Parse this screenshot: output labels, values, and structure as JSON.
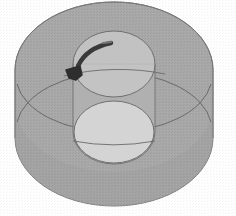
{
  "diagram": {
    "title": "",
    "colors": {
      "background": "#ffffff",
      "outer_fill": "#a9a9a9",
      "outer_fill_dark": "#9a9a9a",
      "inner_top_fill": "#c9c9c9",
      "inner_bottom_fill": "#d6d6d6",
      "inner_side_fill": "#b4b4b4",
      "edge_stroke": "#6e6e6e",
      "arrow": "#3a3a3a"
    },
    "elements": [
      {
        "id": "outer-cylinder",
        "label": "outer cylinder"
      },
      {
        "id": "inner-cylinder",
        "label": "inner cylinder"
      },
      {
        "id": "rotation-arrow",
        "label": "rotation arrow"
      }
    ]
  }
}
